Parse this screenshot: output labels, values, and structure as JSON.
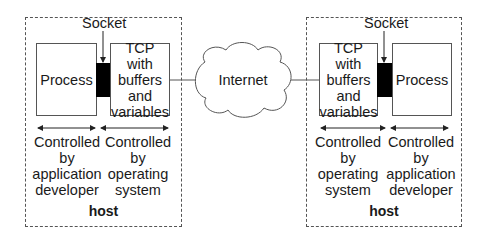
{
  "diagram": {
    "left_host": {
      "host_label": "host",
      "socket_label": "Socket",
      "process_label": "Process",
      "tcp_label": "TCP with\nbuffers\nand\nvariables",
      "app_control_label": "Controlled\nby\napplication\ndeveloper",
      "os_control_label": "Controlled\nby\noperating\nsystem"
    },
    "network": {
      "label": "Internet"
    },
    "right_host": {
      "host_label": "host",
      "socket_label": "Socket",
      "process_label": "Process",
      "tcp_label": "TCP with\nbuffers\nand\nvariables",
      "os_control_label": "Controlled\nby\noperating\nsystem",
      "app_control_label": "Controlled\nby\napplication\ndeveloper"
    },
    "colors": {
      "socket": "#000000",
      "border": "#555555",
      "background": "#ffffff"
    }
  }
}
